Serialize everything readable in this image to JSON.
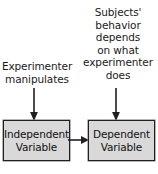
{
  "diagram": {
    "background_color": "#ffffff",
    "text_color": "#1a1a1a",
    "box_fill_color": "#d9d9d9",
    "box_border_color": "#231f20",
    "arrow_color": "#231f20",
    "captions": {
      "independent": {
        "lines": [
          "Experimenter",
          "manipulates"
        ]
      },
      "dependent": {
        "lines": [
          "Subjects'",
          "behavior",
          "depends",
          "on what",
          "experimenter",
          "does"
        ]
      }
    },
    "boxes": {
      "independent": {
        "lines": [
          "Independent",
          "Variable"
        ]
      },
      "dependent": {
        "lines": [
          "Dependent",
          "Variable"
        ]
      }
    },
    "arrows": {
      "independent_down": "arrow-down",
      "dependent_down": "arrow-down",
      "connector": "arrow-right"
    }
  }
}
